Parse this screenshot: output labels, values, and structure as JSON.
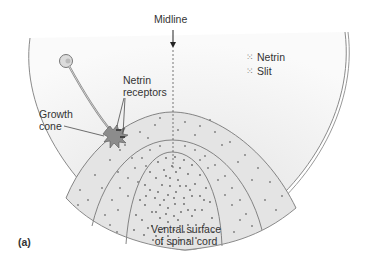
{
  "figure": {
    "panel_label": "(a)",
    "midline_label": "Midline",
    "legend": [
      {
        "symbol": "⁙",
        "label": "Netrin"
      },
      {
        "symbol": "⁙",
        "label": "Slit"
      }
    ],
    "netrin_receptors_label": [
      "Netrin",
      "receptors"
    ],
    "growth_cone_label": [
      "Growth",
      "cone"
    ],
    "ventral_label": [
      "Ventral surface",
      "of spinal cord"
    ]
  },
  "colors": {
    "outline": "#8a8a8a",
    "fill_light": "#eeeeee",
    "dots": "#777777",
    "text": "#333333"
  }
}
